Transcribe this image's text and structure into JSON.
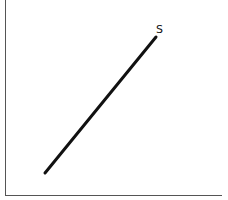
{
  "diagram": {
    "type": "supply-curve",
    "curve_label": "S",
    "axes": {
      "x_label": "",
      "y_label": ""
    },
    "colors": {
      "line": "#111111",
      "axis": "#555555",
      "background": "#ffffff"
    }
  }
}
